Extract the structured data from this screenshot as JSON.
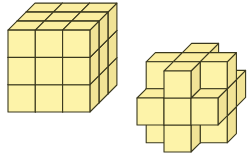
{
  "figure": {
    "colors": {
      "front": "#fdf3a9",
      "top": "#fbeea0",
      "side": "#f1e396",
      "edge": "#3a381e",
      "background": "#ffffff"
    },
    "shapes": [
      {
        "name": "solid-3x3x3-cube",
        "description": "3 x 3 x 3 cube built from 27 unit cubes"
      },
      {
        "name": "cross-shaped-solid",
        "description": "Cube with its 8 corner unit cubes removed (plus/cross arrangement of unit cubes)"
      }
    ]
  }
}
